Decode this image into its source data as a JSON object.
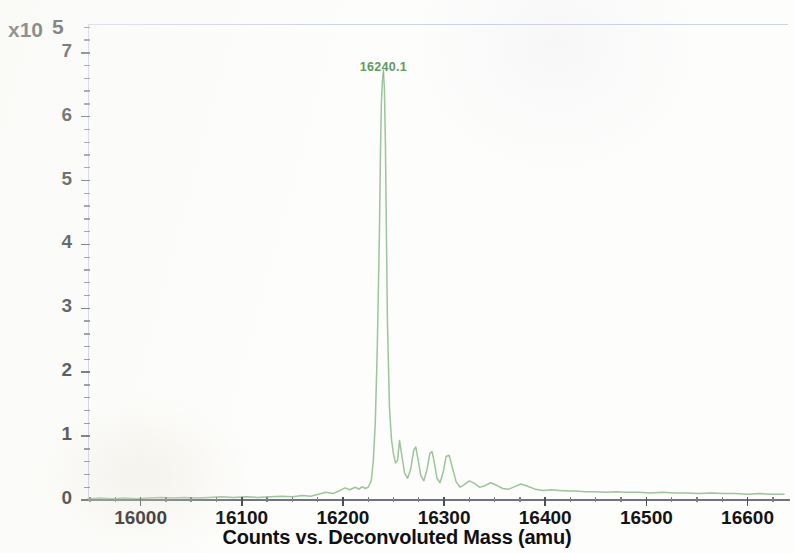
{
  "axis": {
    "y_exponent_prefix": "x10",
    "y_exponent_value": "5",
    "x_title": "Counts vs. Deconvoluted Mass (amu)",
    "y_tick_labels": [
      "7",
      "6",
      "5",
      "4",
      "3",
      "2",
      "1",
      "0"
    ],
    "x_tick_labels": [
      "16000",
      "16100",
      "16200",
      "16300",
      "16400",
      "16500",
      "16600"
    ]
  },
  "annotations": [
    {
      "label": "16240.1",
      "mass": 16240.1,
      "intensity": 6.7
    }
  ],
  "colors": {
    "trace": "#9dc49a",
    "trace_dark": "#7fae7c",
    "annotation": "#5f9a5f",
    "axis": "#6f7480",
    "frame": "#c9cfdf",
    "tick_label": "#141414",
    "background": "#fdfdfc"
  },
  "chart_data": {
    "type": "line",
    "title": "",
    "subtitle": "",
    "xlabel": "Counts vs. Deconvoluted Mass (amu)",
    "ylabel": "Counts",
    "y_scale_factor": 100000,
    "y_scale_label": "x10 5",
    "xlim": [
      15948,
      16640
    ],
    "ylim": [
      0,
      7.45
    ],
    "xticks": [
      16000,
      16100,
      16200,
      16300,
      16400,
      16500,
      16600
    ],
    "yticks": [
      0,
      1,
      2,
      3,
      4,
      5,
      6,
      7
    ],
    "x_minor_tick_step": 25,
    "y_minor_tick_step": 0.2,
    "grid": false,
    "legend": null,
    "annotations": [
      {
        "text": "16240.1",
        "x": 16240.1,
        "y": 6.7
      }
    ],
    "series": [
      {
        "name": "Deconvoluted mass spectrum",
        "color": "#9dc49a",
        "x": [
          15948,
          15960,
          15972,
          15984,
          15996,
          16008,
          16020,
          16032,
          16044,
          16056,
          16068,
          16080,
          16092,
          16104,
          16116,
          16128,
          16140,
          16150,
          16160,
          16168,
          16176,
          16183,
          16190,
          16196,
          16202,
          16207,
          16212,
          16216,
          16219,
          16222,
          16225,
          16228,
          16230,
          16232,
          16234,
          16236,
          16237,
          16238,
          16239,
          16240,
          16241,
          16242,
          16243,
          16244,
          16246,
          16248,
          16250,
          16252,
          16254,
          16256,
          16258,
          16261,
          16264,
          16267,
          16270,
          16272,
          16274,
          16277,
          16280,
          16283,
          16286,
          16288,
          16290,
          16293,
          16296,
          16299,
          16302,
          16305,
          16308,
          16312,
          16316,
          16320,
          16325,
          16330,
          16335,
          16340,
          16346,
          16352,
          16358,
          16364,
          16370,
          16376,
          16382,
          16390,
          16398,
          16406,
          16414,
          16422,
          16430,
          16440,
          16450,
          16460,
          16470,
          16480,
          16492,
          16504,
          16516,
          16528,
          16540,
          16552,
          16564,
          16576,
          16588,
          16600,
          16612,
          16624,
          16636
        ],
        "y": [
          0.02,
          0.03,
          0.02,
          0.03,
          0.02,
          0.03,
          0.04,
          0.03,
          0.04,
          0.03,
          0.04,
          0.05,
          0.04,
          0.05,
          0.04,
          0.05,
          0.06,
          0.05,
          0.07,
          0.06,
          0.09,
          0.12,
          0.1,
          0.14,
          0.19,
          0.16,
          0.2,
          0.17,
          0.21,
          0.18,
          0.2,
          0.3,
          0.6,
          1.2,
          2.4,
          4.1,
          5.3,
          6.2,
          6.55,
          6.7,
          6.45,
          5.6,
          4.2,
          2.8,
          1.45,
          0.95,
          0.72,
          0.58,
          0.62,
          0.93,
          0.72,
          0.42,
          0.34,
          0.48,
          0.78,
          0.83,
          0.66,
          0.38,
          0.3,
          0.47,
          0.73,
          0.76,
          0.62,
          0.34,
          0.27,
          0.43,
          0.68,
          0.7,
          0.52,
          0.28,
          0.2,
          0.24,
          0.3,
          0.26,
          0.2,
          0.22,
          0.27,
          0.23,
          0.18,
          0.17,
          0.21,
          0.25,
          0.22,
          0.17,
          0.15,
          0.16,
          0.15,
          0.14,
          0.14,
          0.13,
          0.13,
          0.12,
          0.13,
          0.12,
          0.12,
          0.11,
          0.12,
          0.11,
          0.11,
          0.1,
          0.11,
          0.1,
          0.1,
          0.09,
          0.1,
          0.09,
          0.09
        ]
      }
    ]
  }
}
